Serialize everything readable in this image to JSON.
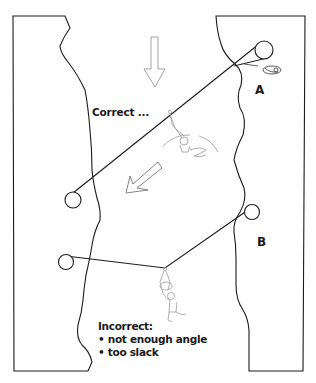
{
  "diagram": {
    "labels": {
      "correct": "Correct ...",
      "anchor_a": "A",
      "anchor_b": "B"
    },
    "incorrect_note": {
      "title": "Incorrect:",
      "bullets": [
        "• not enough angle",
        "• too slack"
      ]
    },
    "colors": {
      "line": "#1a1a1a",
      "sketch": "#9a9a9a",
      "background": "#ffffff"
    }
  }
}
